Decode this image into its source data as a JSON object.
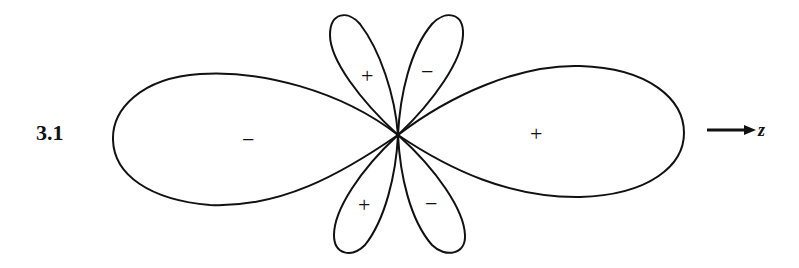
{
  "figure": {
    "number_label": "3.1",
    "axis_label": "z",
    "lobes": {
      "left_large": {
        "sign": "−"
      },
      "right_large": {
        "sign": "+"
      },
      "upper_left_small": {
        "sign": "+"
      },
      "upper_right_small": {
        "sign": "−"
      },
      "lower_left_small": {
        "sign": "+"
      },
      "lower_right_small": {
        "sign": "−"
      }
    },
    "stroke_color": "#111111"
  }
}
